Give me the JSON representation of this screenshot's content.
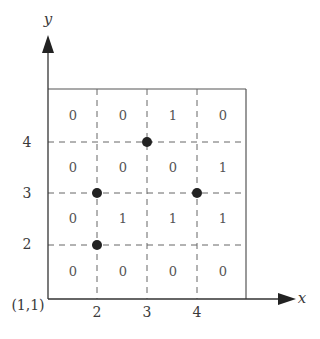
{
  "diagram": {
    "axes": {
      "x_label": "x",
      "y_label": "y",
      "origin_label": "(1,1)",
      "x_ticks": [
        "2",
        "3",
        "4"
      ],
      "y_ticks": [
        "2",
        "3",
        "4"
      ]
    },
    "grid": {
      "columns": 4,
      "rows": 4,
      "cells": [
        [
          "0",
          "0",
          "1",
          "0"
        ],
        [
          "0",
          "0",
          "0",
          "1"
        ],
        [
          "0",
          "1",
          "1",
          "1"
        ],
        [
          "0",
          "0",
          "0",
          "0"
        ]
      ]
    },
    "points": [
      {
        "x": 3,
        "y": 4
      },
      {
        "x": 2,
        "y": 3
      },
      {
        "x": 4,
        "y": 3
      },
      {
        "x": 2,
        "y": 2
      }
    ],
    "colors": {
      "axis": "#333333",
      "box": "#555555",
      "dashed": "#666666",
      "point": "#222222"
    }
  }
}
